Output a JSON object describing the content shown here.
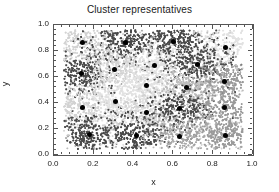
{
  "chart_data": {
    "type": "scatter",
    "title": "Cluster representatives",
    "xlabel": "x",
    "ylabel": "y",
    "xlim": [
      0.0,
      1.0
    ],
    "ylim": [
      0.0,
      1.0
    ],
    "grid": false,
    "legend": false,
    "xticks": [
      0.0,
      0.2,
      0.4,
      0.6,
      0.8,
      1.0
    ],
    "xtick_labels": [
      "0.0",
      "0.2",
      "0.4",
      "0.6",
      "0.8",
      "1.0"
    ],
    "yticks": [
      0.0,
      0.2,
      0.4,
      0.6,
      0.8,
      1.0
    ],
    "ytick_labels": [
      "0.0",
      "0.2",
      "0.4",
      "0.6",
      "0.8",
      "1.0"
    ],
    "minor_tick_count": 4,
    "data_extent": {
      "xmin": 0.05,
      "xmax": 0.95,
      "ymin": 0.04,
      "ymax": 0.96
    },
    "point_count": 4000,
    "point_size": 1.1,
    "cluster_colors": [
      "#d2d2d2",
      "#4a4a4a",
      "#9a9a9a",
      "#bcbcbc",
      "#6e6e6e",
      "#e2e2e2",
      "#868686",
      "#a8a8a8"
    ],
    "marker_color": "#000000",
    "marker_size": 5,
    "axis_color": "#555555",
    "text_color": "#1a1a1a",
    "background": "#ffffff",
    "series": [
      {
        "name": "cluster representatives",
        "marker": "filled-circle",
        "color": "#000000",
        "points": [
          {
            "x": 0.145,
            "y": 0.868
          },
          {
            "x": 0.359,
            "y": 0.862
          },
          {
            "x": 0.603,
            "y": 0.874
          },
          {
            "x": 0.861,
            "y": 0.83
          },
          {
            "x": 0.137,
            "y": 0.628
          },
          {
            "x": 0.306,
            "y": 0.657
          },
          {
            "x": 0.504,
            "y": 0.688
          },
          {
            "x": 0.722,
            "y": 0.698
          },
          {
            "x": 0.858,
            "y": 0.566
          },
          {
            "x": 0.463,
            "y": 0.534
          },
          {
            "x": 0.668,
            "y": 0.519
          },
          {
            "x": 0.145,
            "y": 0.363
          },
          {
            "x": 0.308,
            "y": 0.41
          },
          {
            "x": 0.463,
            "y": 0.33
          },
          {
            "x": 0.629,
            "y": 0.357
          },
          {
            "x": 0.857,
            "y": 0.362
          },
          {
            "x": 0.177,
            "y": 0.155
          },
          {
            "x": 0.417,
            "y": 0.152
          },
          {
            "x": 0.63,
            "y": 0.143
          },
          {
            "x": 0.86,
            "y": 0.147
          }
        ]
      }
    ],
    "clusters": [
      {
        "id": 0,
        "color": "#d2d2d2",
        "center": {
          "x": 0.145,
          "y": 0.868
        },
        "n": 200,
        "spread": 0.085
      },
      {
        "id": 1,
        "color": "#4a4a4a",
        "center": {
          "x": 0.359,
          "y": 0.862
        },
        "n": 230,
        "spread": 0.09
      },
      {
        "id": 2,
        "color": "#4a4a4a",
        "center": {
          "x": 0.603,
          "y": 0.874
        },
        "n": 230,
        "spread": 0.085
      },
      {
        "id": 3,
        "color": "#e2e2e2",
        "center": {
          "x": 0.861,
          "y": 0.83
        },
        "n": 215,
        "spread": 0.095
      },
      {
        "id": 4,
        "color": "#4a4a4a",
        "center": {
          "x": 0.137,
          "y": 0.628
        },
        "n": 235,
        "spread": 0.085
      },
      {
        "id": 5,
        "color": "#d2d2d2",
        "center": {
          "x": 0.306,
          "y": 0.657
        },
        "n": 205,
        "spread": 0.09
      },
      {
        "id": 6,
        "color": "#e2e2e2",
        "center": {
          "x": 0.504,
          "y": 0.688
        },
        "n": 210,
        "spread": 0.095
      },
      {
        "id": 7,
        "color": "#4a4a4a",
        "center": {
          "x": 0.722,
          "y": 0.698
        },
        "n": 230,
        "spread": 0.09
      },
      {
        "id": 8,
        "color": "#9a9a9a",
        "center": {
          "x": 0.858,
          "y": 0.566
        },
        "n": 215,
        "spread": 0.09
      },
      {
        "id": 9,
        "color": "#e2e2e2",
        "center": {
          "x": 0.463,
          "y": 0.534
        },
        "n": 205,
        "spread": 0.09
      },
      {
        "id": 10,
        "color": "#bcbcbc",
        "center": {
          "x": 0.668,
          "y": 0.519
        },
        "n": 210,
        "spread": 0.09
      },
      {
        "id": 11,
        "color": "#d2d2d2",
        "center": {
          "x": 0.145,
          "y": 0.363
        },
        "n": 205,
        "spread": 0.09
      },
      {
        "id": 12,
        "color": "#e2e2e2",
        "center": {
          "x": 0.308,
          "y": 0.41
        },
        "n": 205,
        "spread": 0.09
      },
      {
        "id": 13,
        "color": "#d2d2d2",
        "center": {
          "x": 0.463,
          "y": 0.33
        },
        "n": 205,
        "spread": 0.09
      },
      {
        "id": 14,
        "color": "#4a4a4a",
        "center": {
          "x": 0.629,
          "y": 0.357
        },
        "n": 230,
        "spread": 0.09
      },
      {
        "id": 15,
        "color": "#9a9a9a",
        "center": {
          "x": 0.857,
          "y": 0.362
        },
        "n": 215,
        "spread": 0.09
      },
      {
        "id": 16,
        "color": "#4a4a4a",
        "center": {
          "x": 0.177,
          "y": 0.155
        },
        "n": 235,
        "spread": 0.09
      },
      {
        "id": 17,
        "color": "#4a4a4a",
        "center": {
          "x": 0.417,
          "y": 0.152
        },
        "n": 230,
        "spread": 0.09
      },
      {
        "id": 18,
        "color": "#a8a8a8",
        "center": {
          "x": 0.63,
          "y": 0.143
        },
        "n": 215,
        "spread": 0.09
      },
      {
        "id": 19,
        "color": "#9a9a9a",
        "center": {
          "x": 0.86,
          "y": 0.147
        },
        "n": 215,
        "spread": 0.09
      }
    ]
  }
}
